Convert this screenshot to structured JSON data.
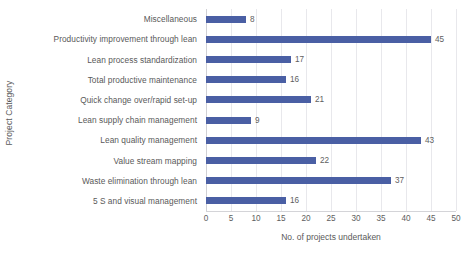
{
  "chart_data": {
    "type": "bar",
    "orientation": "horizontal",
    "title": "",
    "xlabel": "No. of projects undertaken",
    "ylabel": "Project Category",
    "xlim": [
      0,
      50
    ],
    "xticks": [
      0,
      5,
      10,
      15,
      20,
      25,
      30,
      35,
      40,
      45,
      50
    ],
    "grid": true,
    "legend": false,
    "bar_color": "#4a5fa4",
    "text_color": "#595959",
    "categories": [
      "Miscellaneous",
      "Productivity improvement through lean",
      "Lean process standardization",
      "Total productive maintenance",
      "Quick change over/rapid set-up",
      "Lean supply chain management",
      "Lean quality management",
      "Value stream mapping",
      "Waste elimination through lean",
      "5 S and visual management"
    ],
    "values": [
      8,
      45,
      17,
      16,
      21,
      9,
      43,
      22,
      37,
      16
    ],
    "data_labels": [
      "8",
      "45",
      "17",
      "16",
      "21",
      "9",
      "43",
      "22",
      "37",
      "16"
    ]
  }
}
